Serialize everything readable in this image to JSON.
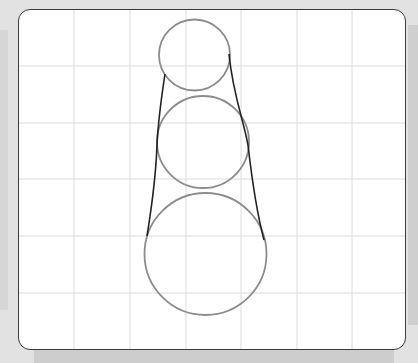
{
  "diagram": {
    "title": "",
    "grid": {
      "vertical_lines_x": [
        74,
        130,
        186,
        241,
        297,
        352
      ],
      "horizontal_lines_y": [
        66,
        123,
        179,
        236,
        293
      ],
      "color": "#dcdcdc"
    },
    "circles": [
      {
        "id": "top-circle",
        "cx": 194.5,
        "cy": 55,
        "r": 35.5
      },
      {
        "id": "middle-circle",
        "cx": 203,
        "cy": 142,
        "r": 46
      },
      {
        "id": "bottom-circle",
        "cx": 205.5,
        "cy": 254,
        "r": 61
      }
    ],
    "circle_color": "#8c8c8c",
    "curves": {
      "left": "M165 74 C161 100 158 125 157 145 C156 175 152 205 147 236",
      "right": "M229 54 C233 95 243 118 248 145 C252 180 256 210 264 240",
      "color": "#222222"
    },
    "colors": {
      "background": "#e2e2e2",
      "frame_fill": "#ffffff",
      "frame_border": "#3a3a3a"
    }
  }
}
